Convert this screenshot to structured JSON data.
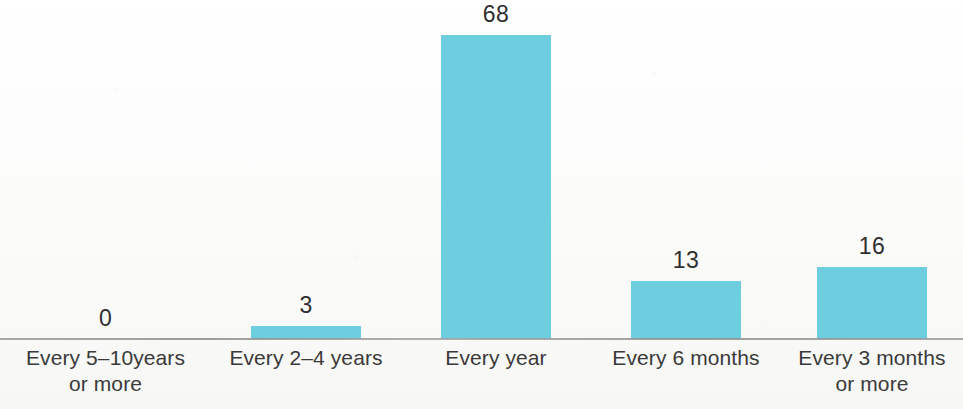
{
  "chart_data": {
    "type": "bar",
    "title": "",
    "subtitle": "",
    "xlabel": "",
    "ylabel": "",
    "grid": false,
    "legend": false,
    "ylim": [
      0,
      68
    ],
    "bar_color": "#6dcedf",
    "label_color": "#3a3a3a",
    "value_color": "#2f2f2f",
    "axis_color": "#9a9a9a",
    "categories": [
      "Every 5–10years or more",
      "Every 2–4 years",
      "Every year",
      "Every 6 months",
      "Every 3 months or more"
    ],
    "values": [
      0,
      3,
      68,
      13,
      16
    ],
    "value_labels": [
      "0",
      "3",
      "68",
      "13",
      "16"
    ],
    "bars": [
      {
        "label_line1": "Every 5–10years",
        "label_line2": "or more",
        "value": 0,
        "value_label": "0"
      },
      {
        "label_line1": "Every 2–4 years",
        "label_line2": "",
        "value": 3,
        "value_label": "3"
      },
      {
        "label_line1": "Every year",
        "label_line2": "",
        "value": 68,
        "value_label": "68"
      },
      {
        "label_line1": "Every 6 months",
        "label_line2": "",
        "value": 13,
        "value_label": "13"
      },
      {
        "label_line1": "Every 3 months",
        "label_line2": "or more",
        "value": 16,
        "value_label": "16"
      }
    ]
  }
}
